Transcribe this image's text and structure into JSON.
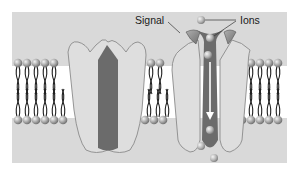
{
  "diagram": {
    "labels": {
      "signal": "Signal",
      "ions": "Ions"
    },
    "colors": {
      "background_panel": "#d9d9d9",
      "page": "#ffffff",
      "channel_body": "#dedede",
      "channel_outline": "#8a8a8a",
      "pore_dark": "#6b6b6b",
      "signal_molecule": "#8d8d8d",
      "lipid_head": "#a9a9a9",
      "lipid_tail": "#222222",
      "ion": "#b5b5b5",
      "arrow": "#ffffff"
    },
    "components": [
      {
        "id": "closed-channel",
        "state": "closed"
      },
      {
        "id": "open-channel",
        "state": "open",
        "bound_signals": 2,
        "ions_in_path": 4
      }
    ]
  }
}
